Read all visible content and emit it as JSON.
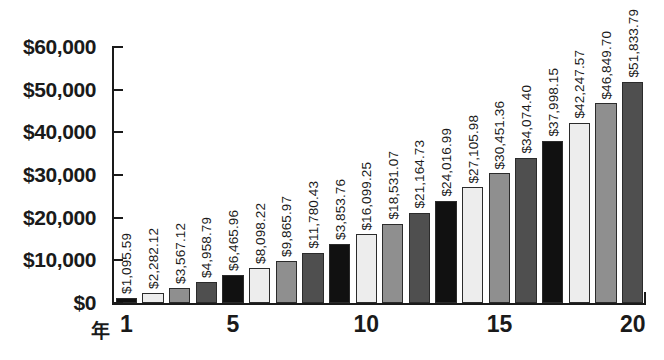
{
  "chart_data": {
    "type": "bar",
    "title": "",
    "subtitle": "",
    "xlabel": "年",
    "ylabel": "",
    "ylim": [
      0,
      60000
    ],
    "grid": false,
    "legend": "none",
    "y_ticks": [
      "$0",
      "$10,000",
      "$20,000",
      "$30,000",
      "$40,000",
      "$50,000",
      "$60,000"
    ],
    "y_tick_values": [
      0,
      10000,
      20000,
      30000,
      40000,
      50000,
      60000
    ],
    "x_ticks": [
      "1",
      "5",
      "10",
      "15",
      "20"
    ],
    "x_tick_values": [
      1,
      5,
      10,
      15,
      20
    ],
    "categories": [
      "1",
      "2",
      "3",
      "4",
      "5",
      "6",
      "7",
      "8",
      "9",
      "10",
      "11",
      "12",
      "13",
      "14",
      "15",
      "16",
      "17",
      "18",
      "19",
      "20"
    ],
    "values": [
      1095.59,
      2282.12,
      3567.12,
      4958.79,
      6465.96,
      8098.22,
      9865.97,
      11780.43,
      3853.76,
      16099.25,
      18531.07,
      21164.73,
      24016.99,
      27105.98,
      30451.36,
      34074.4,
      37998.15,
      42247.57,
      46849.7,
      51833.79
    ],
    "data_labels": [
      "$1,095.59",
      "$2,282.12",
      "$3,567.12",
      "$4,958.79",
      "$6,465.96",
      "$8,098.22",
      "$9,865.97",
      "$11,780.43",
      "$3,853.76",
      "$16,099.25",
      "$18,531.07",
      "$21,164.73",
      "$24,016.99",
      "$27,105.98",
      "$30,451.36",
      "$34,074.40",
      "$37,998.15",
      "$42,247.57",
      "$46,849.70",
      "$51,833.79"
    ],
    "bar_heights": [
      1095.59,
      2282.12,
      3567.12,
      4958.79,
      6465.96,
      8098.22,
      9865.97,
      11780.43,
      13853.76,
      16099.25,
      18531.07,
      21164.73,
      24016.99,
      27105.98,
      30451.36,
      34074.4,
      37998.15,
      42247.57,
      46849.7,
      51833.79
    ],
    "bar_fills": [
      "black",
      "light",
      "medium",
      "dark",
      "black",
      "light",
      "medium",
      "dark",
      "black",
      "light",
      "medium",
      "dark",
      "black",
      "light",
      "medium",
      "dark",
      "black",
      "light",
      "medium",
      "dark"
    ],
    "colors": {
      "black": "#111111",
      "light": "#ededed",
      "medium": "#8f8f8f",
      "dark": "#4f4f4f",
      "axis": "#1a1a1a",
      "background": "#ffffff"
    }
  }
}
